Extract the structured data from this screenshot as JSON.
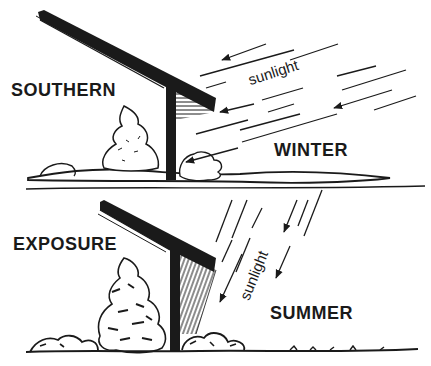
{
  "labels": {
    "southern": "SOUTHERN",
    "exposure": "EXPOSURE",
    "winter": "WINTER",
    "summer": "SUMMER",
    "sunlight_winter": "sunlight",
    "sunlight_summer": "sunlight"
  },
  "colors": {
    "ink": "#1a1a1a",
    "background": "#ffffff"
  },
  "panels": [
    {
      "season": "WINTER",
      "sun_angle": "low",
      "shade": "horizontal-hatch"
    },
    {
      "season": "SUMMER",
      "sun_angle": "high",
      "shade": "diagonal-hatch"
    }
  ]
}
